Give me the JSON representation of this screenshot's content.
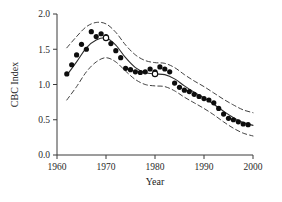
{
  "chart_data": {
    "type": "scatter",
    "title": "",
    "xlabel": "Year",
    "ylabel": "CBC Index",
    "xlim": [
      1960,
      2000
    ],
    "ylim": [
      0.0,
      2.0
    ],
    "grid": false,
    "legend": "none",
    "xticks": [
      1960,
      1970,
      1980,
      1990,
      2000
    ],
    "xtick_labels": [
      "1960",
      "1970",
      "1980",
      "1990",
      "2000"
    ],
    "yticks": [
      0.0,
      0.5,
      1.0,
      1.5,
      2.0
    ],
    "ytick_labels": [
      "0.0",
      "0.5",
      "1.0",
      "1.5",
      "2.0"
    ],
    "series": [
      {
        "name": "CBC index observations (filled circles)",
        "marker": "filled-circle",
        "x": [
          1962,
          1963,
          1964,
          1965,
          1966,
          1967,
          1968,
          1969,
          1970,
          1971,
          1972,
          1973,
          1974,
          1975,
          1976,
          1977,
          1978,
          1979,
          1980,
          1981,
          1982,
          1983,
          1984,
          1985,
          1986,
          1987,
          1988,
          1989,
          1990,
          1991,
          1992,
          1993,
          1994,
          1995,
          1996,
          1997,
          1998,
          1999
        ],
        "y": [
          1.15,
          1.28,
          1.42,
          1.57,
          1.5,
          1.75,
          1.68,
          1.72,
          1.68,
          1.58,
          1.48,
          1.38,
          1.23,
          1.21,
          1.18,
          1.17,
          1.18,
          1.22,
          1.18,
          1.25,
          1.22,
          1.18,
          1.02,
          0.96,
          0.92,
          0.9,
          0.86,
          0.83,
          0.8,
          0.78,
          0.74,
          0.66,
          0.58,
          0.52,
          0.5,
          0.47,
          0.44,
          0.43
        ]
      },
      {
        "name": "Highlighted years (open circles)",
        "marker": "open-circle",
        "x": [
          1970,
          1980
        ],
        "y": [
          1.66,
          1.15
        ]
      },
      {
        "name": "Fitted smooth trend",
        "marker": "solid-line",
        "x": [
          1962,
          1964,
          1966,
          1968,
          1970,
          1972,
          1974,
          1976,
          1978,
          1980,
          1982,
          1984,
          1986,
          1988,
          1990,
          1992,
          1994,
          1996,
          1998,
          2000
        ],
        "y": [
          1.13,
          1.32,
          1.52,
          1.63,
          1.66,
          1.56,
          1.38,
          1.24,
          1.17,
          1.15,
          1.14,
          1.08,
          0.98,
          0.89,
          0.81,
          0.72,
          0.62,
          0.53,
          0.46,
          0.42
        ]
      },
      {
        "name": "Upper confidence band",
        "marker": "dashed-line",
        "x": [
          1962,
          1964,
          1966,
          1968,
          1970,
          1972,
          1974,
          1976,
          1978,
          1980,
          1982,
          1984,
          1986,
          1988,
          1990,
          1992,
          1994,
          1996,
          1998,
          2000
        ],
        "y": [
          1.52,
          1.68,
          1.82,
          1.88,
          1.86,
          1.74,
          1.56,
          1.42,
          1.34,
          1.31,
          1.3,
          1.24,
          1.14,
          1.05,
          0.97,
          0.88,
          0.79,
          0.71,
          0.64,
          0.6
        ]
      },
      {
        "name": "Lower confidence band",
        "marker": "dashed-line",
        "x": [
          1962,
          1964,
          1966,
          1968,
          1970,
          1972,
          1974,
          1976,
          1978,
          1980,
          1982,
          1984,
          1986,
          1988,
          1990,
          1992,
          1994,
          1996,
          1998,
          2000
        ],
        "y": [
          0.78,
          0.97,
          1.18,
          1.32,
          1.38,
          1.32,
          1.19,
          1.07,
          1.0,
          0.98,
          0.97,
          0.91,
          0.82,
          0.74,
          0.66,
          0.57,
          0.47,
          0.38,
          0.31,
          0.27
        ]
      }
    ],
    "colors": {
      "marker": "#0d0d0d",
      "fit_line": "#2b2b2b",
      "ci_line": "#2b2b2b",
      "axis": "#3a3a3a",
      "background": "#ffffff"
    }
  }
}
